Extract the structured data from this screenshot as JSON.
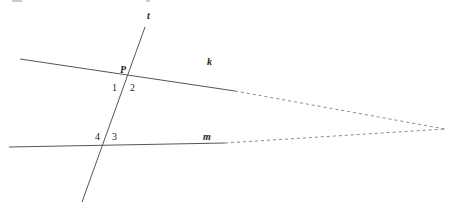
{
  "diagram": {
    "title_fragment": "",
    "lines": {
      "t": {
        "label": "t",
        "x1": 145,
        "y1": 27,
        "x2": 82,
        "y2": 202
      },
      "k": {
        "label": "k",
        "solid": {
          "x1": 20,
          "y1": 59,
          "x2": 235,
          "y2": 91
        },
        "dashed": {
          "x1": 235,
          "y1": 91,
          "x2": 445,
          "y2": 129
        }
      },
      "m": {
        "label": "m",
        "solid": {
          "x1": 9,
          "y1": 147,
          "x2": 225,
          "y2": 143
        },
        "dashed": {
          "x1": 225,
          "y1": 143,
          "x2": 445,
          "y2": 129
        }
      }
    },
    "points": {
      "P": {
        "label": "P"
      }
    },
    "angles": {
      "a1": "1",
      "a2": "2",
      "a3": "3",
      "a4": "4"
    },
    "colors": {
      "solid": "#555555",
      "dashed": "#8a8a8a",
      "text": "#222222"
    }
  }
}
